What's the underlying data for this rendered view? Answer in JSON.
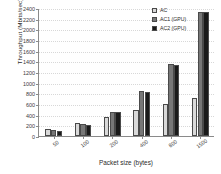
{
  "chart_data": {
    "type": "bar",
    "title": "",
    "xlabel": "Packet size (bytes)",
    "ylabel": "Throughput (Mbits/sec)",
    "categories": [
      "50",
      "100",
      "200",
      "400",
      "800",
      "1500"
    ],
    "series": [
      {
        "name": "AC",
        "color": "#d9d9d9",
        "values": [
          140,
          250,
          355,
          490,
          600,
          720
        ]
      },
      {
        "name": "AC1 (GPU)",
        "color": "#777777",
        "values": [
          110,
          225,
          450,
          850,
          1350,
          2330
        ]
      },
      {
        "name": "AC2 (GPU)",
        "color": "#1a1a1a",
        "values": [
          95,
          215,
          450,
          820,
          1340,
          2330
        ]
      }
    ],
    "ylim": [
      0,
      2400
    ],
    "ytick_step": 200,
    "yticks": [
      "0",
      "200",
      "400",
      "600",
      "800",
      "1000",
      "1200",
      "1400",
      "1600",
      "1800",
      "2000",
      "2200",
      "2400"
    ],
    "grid": true,
    "legend_position": "top-right",
    "axis_color": "#8a8a8a",
    "grid_color": "#d8d8d8",
    "background": "#ffffff"
  }
}
